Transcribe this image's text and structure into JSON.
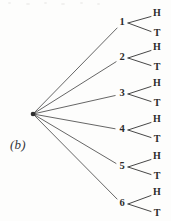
{
  "figure": {
    "panel_label": "(b)",
    "type": "probability-tree-diagram",
    "width": 171,
    "height": 221,
    "background_color": "#fdfdfc",
    "line_color": "#4a4a4a",
    "text_color": "#2b2b2b"
  },
  "tree": {
    "root": {
      "x": 33,
      "y": 114,
      "name": "root-node"
    },
    "level1_x": 122,
    "level2_x": 157,
    "branch_start_x": 128,
    "branch_end_x": 151,
    "nodes": [
      {
        "label": "1",
        "x": 122,
        "y": 23,
        "outcomes": [
          {
            "label": "H",
            "x": 157,
            "y": 14
          },
          {
            "label": "T",
            "x": 157,
            "y": 34
          }
        ]
      },
      {
        "label": "2",
        "x": 122,
        "y": 58,
        "outcomes": [
          {
            "label": "H",
            "x": 157,
            "y": 48
          },
          {
            "label": "T",
            "x": 157,
            "y": 68
          }
        ]
      },
      {
        "label": "3",
        "x": 122,
        "y": 94,
        "outcomes": [
          {
            "label": "H",
            "x": 157,
            "y": 84
          },
          {
            "label": "T",
            "x": 157,
            "y": 104
          }
        ]
      },
      {
        "label": "4",
        "x": 122,
        "y": 130,
        "outcomes": [
          {
            "label": "H",
            "x": 157,
            "y": 120
          },
          {
            "label": "T",
            "x": 157,
            "y": 140
          }
        ]
      },
      {
        "label": "5",
        "x": 122,
        "y": 167,
        "outcomes": [
          {
            "label": "H",
            "x": 157,
            "y": 157
          },
          {
            "label": "T",
            "x": 157,
            "y": 177
          }
        ]
      },
      {
        "label": "6",
        "x": 122,
        "y": 204,
        "outcomes": [
          {
            "label": "H",
            "x": 157,
            "y": 193
          },
          {
            "label": "T",
            "x": 157,
            "y": 214
          }
        ]
      }
    ]
  }
}
